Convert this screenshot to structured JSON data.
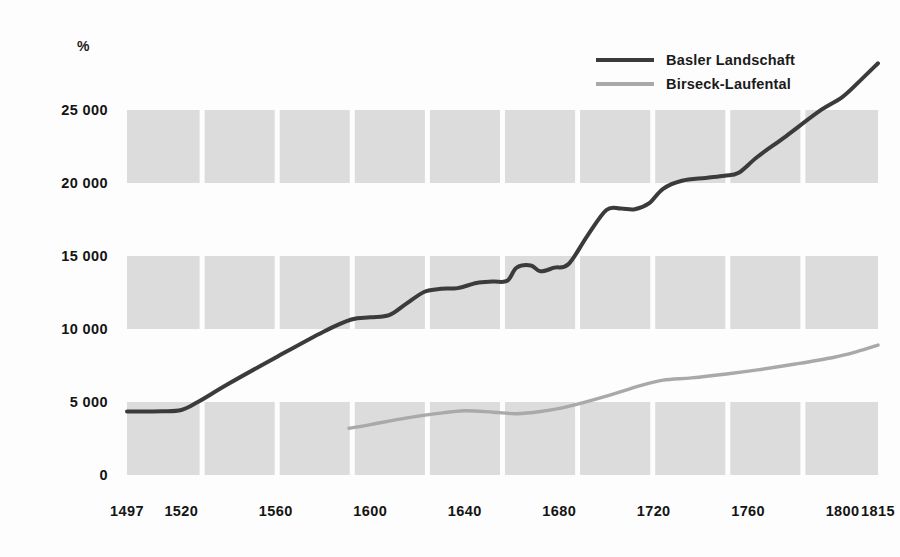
{
  "chart_data": {
    "type": "line",
    "title": "",
    "subtitle": "",
    "xlabel": "",
    "ylabel": "%",
    "unit_label": "%",
    "xlim": [
      1497,
      1815
    ],
    "ylim": [
      0,
      28500
    ],
    "yticks": [
      0,
      5000,
      10000,
      15000,
      20000,
      25000
    ],
    "ytick_labels": [
      "0",
      "5 000",
      "10 000",
      "15 000",
      "20 000",
      "25 000"
    ],
    "xticks": [
      1497,
      1520,
      1560,
      1600,
      1640,
      1680,
      1720,
      1760,
      1800,
      1815
    ],
    "xtick_labels": [
      "1497",
      "1520",
      "1560",
      "1600",
      "1640",
      "1680",
      "1720",
      "1760",
      "1800",
      "1815"
    ],
    "grid": "alternating-horizontal-bands-with-vertical-column-gaps",
    "legend_position": "top-right",
    "series": [
      {
        "name": "Basler Landschaft",
        "color": "#3b3b3b",
        "points": [
          [
            1497,
            4350
          ],
          [
            1505,
            4350
          ],
          [
            1512,
            4360
          ],
          [
            1520,
            4450
          ],
          [
            1527,
            5000
          ],
          [
            1540,
            6250
          ],
          [
            1560,
            8050
          ],
          [
            1580,
            9800
          ],
          [
            1592,
            10650
          ],
          [
            1600,
            10800
          ],
          [
            1608,
            10950
          ],
          [
            1615,
            11700
          ],
          [
            1623,
            12550
          ],
          [
            1630,
            12750
          ],
          [
            1637,
            12800
          ],
          [
            1645,
            13150
          ],
          [
            1652,
            13250
          ],
          [
            1658,
            13300
          ],
          [
            1662,
            14200
          ],
          [
            1668,
            14350
          ],
          [
            1672,
            13950
          ],
          [
            1678,
            14200
          ],
          [
            1684,
            14450
          ],
          [
            1692,
            16400
          ],
          [
            1700,
            18150
          ],
          [
            1706,
            18250
          ],
          [
            1712,
            18200
          ],
          [
            1718,
            18600
          ],
          [
            1724,
            19600
          ],
          [
            1732,
            20150
          ],
          [
            1742,
            20350
          ],
          [
            1750,
            20500
          ],
          [
            1756,
            20700
          ],
          [
            1764,
            21800
          ],
          [
            1776,
            23200
          ],
          [
            1790,
            24900
          ],
          [
            1800,
            25900
          ],
          [
            1808,
            27100
          ],
          [
            1815,
            28200
          ]
        ]
      },
      {
        "name": "Birseck-Laufental",
        "color": "#a9a9a9",
        "points": [
          [
            1591,
            3200
          ],
          [
            1600,
            3450
          ],
          [
            1615,
            3900
          ],
          [
            1628,
            4200
          ],
          [
            1640,
            4400
          ],
          [
            1652,
            4300
          ],
          [
            1662,
            4200
          ],
          [
            1672,
            4350
          ],
          [
            1684,
            4700
          ],
          [
            1700,
            5400
          ],
          [
            1714,
            6100
          ],
          [
            1724,
            6500
          ],
          [
            1736,
            6650
          ],
          [
            1750,
            6900
          ],
          [
            1764,
            7200
          ],
          [
            1780,
            7600
          ],
          [
            1796,
            8050
          ],
          [
            1806,
            8450
          ],
          [
            1815,
            8900
          ]
        ]
      }
    ]
  },
  "legend": {
    "items": [
      {
        "label": "Basler Landschaft",
        "color": "#3b3b3b"
      },
      {
        "label": "Birseck-Laufental",
        "color": "#a9a9a9"
      }
    ]
  },
  "style": {
    "band_color": "#dcdcdc",
    "background": "#fdfdfd",
    "text_color": "#141414"
  }
}
